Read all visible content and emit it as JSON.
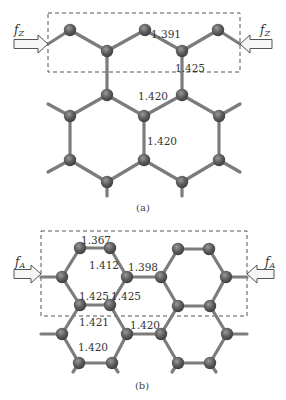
{
  "colors": {
    "atom": "#5a5a5a",
    "atom_highlight": "#9a9a9a",
    "bond": "#7c7c7c",
    "box": "#555555",
    "arrow_fill": "#f6f6f6"
  },
  "panel_a": {
    "caption": "(a)",
    "force_label": "f",
    "force_sub": "Z",
    "bond_labels": [
      {
        "text": "1.391",
        "x": 166,
        "y": 38
      },
      {
        "text": "1.425",
        "x": 190,
        "y": 72
      },
      {
        "text": "1.420",
        "x": 153,
        "y": 100
      },
      {
        "text": "1.420",
        "x": 162,
        "y": 145
      }
    ],
    "box": {
      "x": 48,
      "y": 13,
      "w": 192,
      "h": 59
    },
    "atoms": [
      [
        70,
        30
      ],
      [
        145,
        30
      ],
      [
        218,
        30
      ],
      [
        107,
        51
      ],
      [
        182,
        51
      ],
      [
        107,
        95
      ],
      [
        182,
        95
      ],
      [
        70,
        116
      ],
      [
        144,
        116
      ],
      [
        219,
        116
      ],
      [
        70,
        160
      ],
      [
        144,
        160
      ],
      [
        219,
        160
      ],
      [
        107,
        182
      ],
      [
        182,
        182
      ]
    ],
    "bonds": [
      [
        48,
        44,
        70,
        30
      ],
      [
        70,
        30,
        107,
        51
      ],
      [
        107,
        51,
        145,
        30
      ],
      [
        145,
        30,
        182,
        51
      ],
      [
        182,
        51,
        218,
        30
      ],
      [
        218,
        30,
        240,
        44
      ],
      [
        107,
        51,
        107,
        95
      ],
      [
        182,
        51,
        182,
        95
      ],
      [
        107,
        95,
        70,
        116
      ],
      [
        107,
        95,
        144,
        116
      ],
      [
        144,
        116,
        182,
        95
      ],
      [
        182,
        95,
        219,
        116
      ],
      [
        70,
        116,
        48,
        104
      ],
      [
        219,
        116,
        240,
        104
      ],
      [
        70,
        116,
        70,
        160
      ],
      [
        144,
        116,
        144,
        160
      ],
      [
        219,
        116,
        219,
        160
      ],
      [
        70,
        160,
        48,
        172
      ],
      [
        70,
        160,
        107,
        182
      ],
      [
        107,
        182,
        144,
        160
      ],
      [
        144,
        160,
        182,
        182
      ],
      [
        182,
        182,
        219,
        160
      ],
      [
        219,
        160,
        240,
        172
      ],
      [
        107,
        182,
        107,
        196
      ],
      [
        182,
        182,
        182,
        196
      ]
    ],
    "arrows": {
      "left": {
        "x1": 14,
        "x2": 48,
        "y": 44
      },
      "right": {
        "x1": 272,
        "x2": 240,
        "y": 44
      }
    },
    "force_positions": {
      "left": [
        14,
        34
      ],
      "right": [
        260,
        34
      ]
    },
    "caption_pos": [
      143,
      211
    ]
  },
  "panel_b": {
    "caption": "(b)",
    "force_label": "f",
    "force_sub": "A",
    "bond_labels": [
      {
        "text": "1.367",
        "x": 96,
        "y": 244
      },
      {
        "text": "1.412",
        "x": 104,
        "y": 269
      },
      {
        "text": "1.398",
        "x": 143,
        "y": 271
      },
      {
        "text": "1.425",
        "x": 94,
        "y": 300
      },
      {
        "text": "1.425",
        "x": 126,
        "y": 300
      },
      {
        "text": "1.421",
        "x": 94,
        "y": 326
      },
      {
        "text": "1.420",
        "x": 145,
        "y": 329
      },
      {
        "text": "1.420",
        "x": 93,
        "y": 351
      }
    ],
    "box": {
      "x": 41,
      "y": 231,
      "w": 206,
      "h": 85
    },
    "atoms": [
      [
        80,
        248
      ],
      [
        110,
        248
      ],
      [
        178,
        249
      ],
      [
        209,
        249
      ],
      [
        62,
        277
      ],
      [
        127,
        277
      ],
      [
        161,
        277
      ],
      [
        226,
        277
      ],
      [
        80,
        305
      ],
      [
        110,
        305
      ],
      [
        178,
        306
      ],
      [
        210,
        306
      ],
      [
        62,
        334
      ],
      [
        127,
        334
      ],
      [
        161,
        334
      ],
      [
        227,
        334
      ],
      [
        79,
        363
      ],
      [
        112,
        363
      ],
      [
        178,
        363
      ],
      [
        210,
        363
      ]
    ],
    "bonds": [
      [
        80,
        248,
        110,
        248
      ],
      [
        178,
        249,
        209,
        249
      ],
      [
        80,
        248,
        62,
        277
      ],
      [
        110,
        248,
        127,
        277
      ],
      [
        178,
        249,
        161,
        277
      ],
      [
        209,
        249,
        226,
        277
      ],
      [
        41,
        277,
        62,
        277
      ],
      [
        127,
        277,
        161,
        277
      ],
      [
        226,
        277,
        247,
        277
      ],
      [
        62,
        277,
        80,
        305
      ],
      [
        127,
        277,
        110,
        305
      ],
      [
        161,
        277,
        178,
        306
      ],
      [
        226,
        277,
        210,
        306
      ],
      [
        80,
        305,
        110,
        305
      ],
      [
        178,
        306,
        210,
        306
      ],
      [
        80,
        305,
        62,
        334
      ],
      [
        110,
        305,
        127,
        334
      ],
      [
        178,
        306,
        161,
        334
      ],
      [
        210,
        306,
        227,
        334
      ],
      [
        41,
        334,
        62,
        334
      ],
      [
        127,
        334,
        161,
        334
      ],
      [
        227,
        334,
        247,
        334
      ],
      [
        62,
        334,
        79,
        363
      ],
      [
        127,
        334,
        112,
        363
      ],
      [
        161,
        334,
        178,
        363
      ],
      [
        227,
        334,
        210,
        363
      ],
      [
        79,
        363,
        112,
        363
      ],
      [
        178,
        363,
        210,
        363
      ],
      [
        79,
        363,
        73,
        372
      ],
      [
        112,
        363,
        118,
        372
      ],
      [
        178,
        363,
        172,
        372
      ],
      [
        210,
        363,
        216,
        372
      ]
    ],
    "arrows": {
      "left": {
        "x1": 14,
        "x2": 41,
        "y": 274
      },
      "right": {
        "x1": 274,
        "x2": 247,
        "y": 274
      }
    },
    "force_positions": {
      "left": [
        15,
        266
      ],
      "right": [
        265,
        266
      ]
    },
    "caption_pos": [
      142,
      389
    ]
  }
}
